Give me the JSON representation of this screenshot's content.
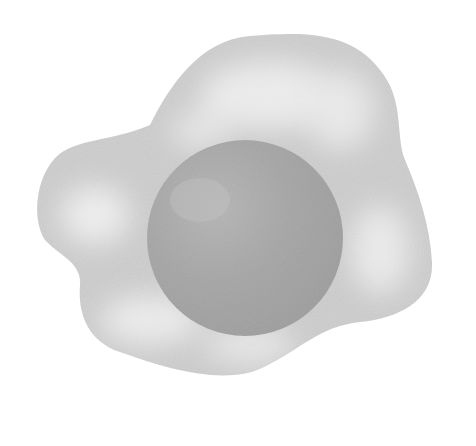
{
  "image": {
    "subject": "fried egg illustration",
    "style": "grayscale watercolor",
    "background_color": "#ffffff"
  },
  "egg_white": {
    "fill_color": "#d2d2d2",
    "highlight_color": "#eeeeee",
    "edge_color": "#c4c4c4"
  },
  "yolk": {
    "fill_color": "#a9a9a9",
    "highlight_color": "#bdbdbd",
    "center": [
      245,
      238
    ],
    "radius": 98
  }
}
